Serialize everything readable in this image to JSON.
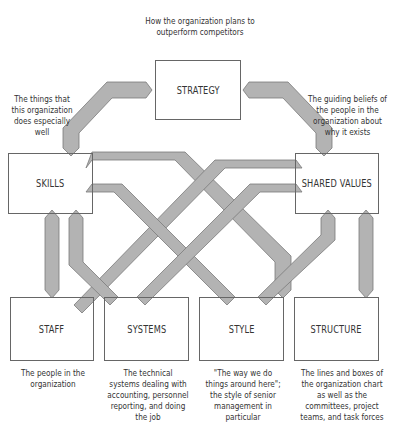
{
  "elements": {
    "strategy": {
      "label": "STRATEGY",
      "description": "How the organization plans to outperform competitors"
    },
    "skills": {
      "label": "SKILLS",
      "description": "The things that this organization does especially well"
    },
    "shared_values": {
      "label": "SHARED VALUES",
      "description": "The guiding beliefs of the people in the organization about why it exists"
    },
    "staff": {
      "label": "STAFF",
      "description": "The people in the organization"
    },
    "systems": {
      "label": "SYSTEMS",
      "description": "The technical systems dealing with accounting, personnel reporting, and doing the job"
    },
    "style": {
      "label": "STYLE",
      "description": "\"The way we do things around here\"; the style of senior management in particular"
    },
    "structure": {
      "label": "STRUCTURE",
      "description": "The lines and boxes of the organization chart as well as the committees, project teams, and task forces"
    }
  },
  "connections": [
    {
      "from": "strategy",
      "to": "skills"
    },
    {
      "from": "strategy",
      "to": "shared_values"
    },
    {
      "from": "skills",
      "to": "shared_values"
    },
    {
      "from": "skills",
      "to": "staff"
    },
    {
      "from": "skills",
      "to": "systems"
    },
    {
      "from": "skills",
      "to": "style"
    },
    {
      "from": "skills",
      "to": "structure"
    },
    {
      "from": "shared_values",
      "to": "staff"
    },
    {
      "from": "shared_values",
      "to": "systems"
    },
    {
      "from": "shared_values",
      "to": "style"
    },
    {
      "from": "shared_values",
      "to": "structure"
    }
  ],
  "colors": {
    "arrow_fill": "#b3b3b3",
    "arrow_stroke": "#7a7a7a",
    "box_border": "#666666",
    "text": "#333333"
  }
}
